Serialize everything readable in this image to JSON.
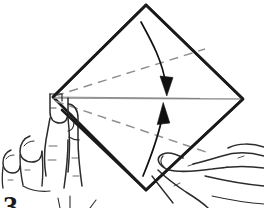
{
  "figure": {
    "step_number": "3",
    "caption": "",
    "background_color": "#ffffff",
    "ink_color": "#1a1a1a",
    "fold_line_color": "#9a9a9a",
    "crease_line_color": "#8f8f8f",
    "arrow_color": "#111111"
  },
  "paper": {
    "name": "square-sheet-diamond",
    "description": "Square sheet of paper held as a diamond",
    "vertices": {
      "top": [
        146,
        5
      ],
      "right": [
        243,
        99
      ],
      "bottom": [
        146,
        190
      ],
      "left": [
        53,
        97
      ]
    },
    "outline_color": "#1a1a1a",
    "outline_width": 2.6
  },
  "horizontal_fold": {
    "name": "center-horizontal-fold-line",
    "from": [
      53,
      98
    ],
    "to": [
      243,
      99
    ],
    "color": "#9a9a9a",
    "width": 1.2
  },
  "creases": [
    {
      "name": "upper-crease-dashed",
      "from": [
        55,
        96
      ],
      "to": [
        205,
        49
      ],
      "style": "dashed",
      "color": "#8f8f8f"
    },
    {
      "name": "lower-crease-dashed",
      "from": [
        55,
        101
      ],
      "to": [
        206,
        152
      ],
      "style": "dashed",
      "color": "#8f8f8f"
    }
  ],
  "arrows": [
    {
      "name": "fold-down-arrow",
      "direction": "down",
      "label": "fold top half down",
      "tip": [
        167,
        95
      ],
      "tail": [
        141,
        22
      ],
      "color": "#111111"
    },
    {
      "name": "fold-up-arrow",
      "direction": "up",
      "label": "fold bottom half up",
      "tip": [
        163,
        102
      ],
      "tail": [
        143,
        175
      ],
      "color": "#111111"
    }
  ],
  "hands": [
    {
      "name": "left-hand",
      "position": "left",
      "description": "Left hand pinching the left corner of the paper between thumb and index finger",
      "fingers": 4,
      "line_color": "#2b2b2b"
    },
    {
      "name": "right-hand",
      "position": "bottom-right",
      "description": "Right hand entering from lower right, index finger touching the bottom corner",
      "fingers": 4,
      "line_color": "#2b2b2b"
    }
  ]
}
